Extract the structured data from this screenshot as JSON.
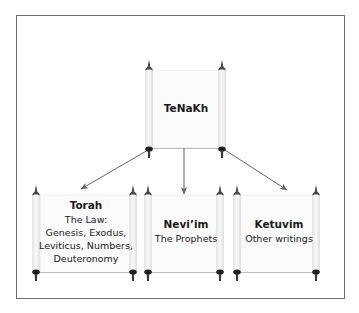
{
  "diagram": {
    "root": {
      "title": "TeNaKh"
    },
    "children": [
      {
        "title": "Torah",
        "lines": [
          "The Law:",
          "Genesis, Exodus,",
          "Leviticus, Numbers,",
          "Deuteronomy"
        ]
      },
      {
        "title": "Nevi’im",
        "lines": [
          "The Prophets"
        ]
      },
      {
        "title": "Ketuvim",
        "lines": [
          "Other writings"
        ]
      }
    ],
    "colors": {
      "frame": "#6e6e6e",
      "arrow": "#666666",
      "handle": "#2a2a2a",
      "text": "#1a1a1a"
    }
  }
}
